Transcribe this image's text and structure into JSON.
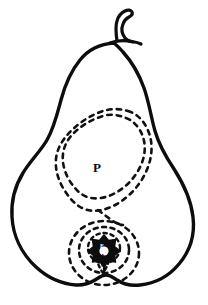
{
  "figure": {
    "view": "longitudinal section",
    "style": "ink line drawing",
    "background_color": "#ffffff",
    "outline_color": "#0d0d0d",
    "dashed_color": "#111111"
  },
  "labels": {
    "pericarp": "P",
    "core_center": "E",
    "core_lower_a": "A",
    "core_lower_b": "W"
  },
  "parts": {
    "stem": "stem",
    "body_outline": "pear-body-outline",
    "pericarp_outer_contour": "dashed-outer-contour",
    "pericarp_inner_contour": "dashed-inner-contour",
    "core_ring_outer": "dashed-core-ring-outer",
    "core_ring_middle": "dashed-core-ring-middle",
    "core_ring_inner": "dashed-core-ring-inner",
    "core_star": "solid-star-core"
  }
}
